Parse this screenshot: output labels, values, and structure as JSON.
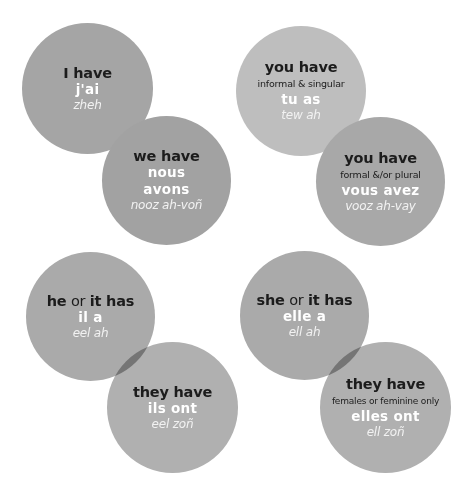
{
  "colors": {
    "circle_gray": "#a5a5a5",
    "circle_light": "#bebebe",
    "heading_text": "#1c1c1c",
    "french_text": "#ffffff"
  },
  "cards": [
    {
      "id": "i-have",
      "heading": "I have",
      "note": "",
      "french": "j'ai",
      "pronunciation": "zheh"
    },
    {
      "id": "we-have",
      "heading": "we have",
      "note": "",
      "french": "nous avons",
      "pronunciation": "nooz ah-voñ"
    },
    {
      "id": "you-have-informal",
      "heading": "you have",
      "note": "informal & singular",
      "french": "tu as",
      "pronunciation": "tew ah"
    },
    {
      "id": "you-have-formal",
      "heading": "you have",
      "note": "formal &/or plural",
      "french": "vous avez",
      "pronunciation": "vooz ah-vay"
    },
    {
      "id": "he-it-has",
      "heading_parts": [
        "he",
        " or ",
        "it has"
      ],
      "note": "",
      "french": "il a",
      "pronunciation": "eel ah"
    },
    {
      "id": "they-have-ils",
      "heading": "they have",
      "note": "",
      "french": "ils ont",
      "pronunciation": "eel zoñ"
    },
    {
      "id": "she-it-has",
      "heading_parts": [
        "she",
        " or ",
        "it has"
      ],
      "note": "",
      "french": "elle a",
      "pronunciation": "ell ah"
    },
    {
      "id": "they-have-elles",
      "heading": "they have",
      "note": "females or feminine only",
      "french": "elles ont",
      "pronunciation": "ell zoñ"
    }
  ]
}
